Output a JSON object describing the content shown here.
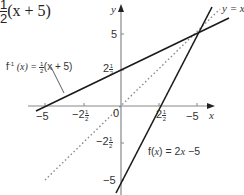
{
  "header_fragment": {
    "frac_num": "1",
    "frac_den": "2",
    "expr": "(x + 5)"
  },
  "axes": {
    "x_label": "x",
    "y_label": "y",
    "origin_label": "0",
    "x_ticks": [
      {
        "value": -5,
        "label": "−5"
      },
      {
        "value": -2.5,
        "whole": "−2",
        "num": "1",
        "den": "2"
      },
      {
        "value": 2.5,
        "whole": "2",
        "num": "1",
        "den": "2"
      },
      {
        "value": 5,
        "label": "−5"
      }
    ],
    "y_ticks": [
      {
        "value": 5,
        "label": "5"
      },
      {
        "value": 2.5,
        "whole": "2",
        "num": "1",
        "den": "2"
      },
      {
        "value": -2.5,
        "whole": "−2",
        "num": "1",
        "den": "2"
      },
      {
        "value": -5,
        "label": "−5"
      }
    ]
  },
  "labels": {
    "inverse": {
      "prefix": "f",
      "sup": "-1",
      "arg": " (x) = ",
      "num": "1",
      "den": "2",
      "rest": "(x + 5)"
    },
    "function": {
      "text_pre": "f(",
      "var": "x",
      "text_post": ") = 2",
      "var2": "x",
      "text_end": " −5"
    },
    "identity": {
      "text": "y = x"
    }
  },
  "lines": [
    {
      "name": "f(x) = 2x − 5",
      "slope": 2,
      "intercept": -5,
      "style": "solid",
      "color": "#1a1a1a"
    },
    {
      "name": "f⁻¹(x) = ½(x + 5)",
      "slope": 0.5,
      "intercept": 2.5,
      "style": "solid",
      "color": "#1a1a1a"
    },
    {
      "name": "y = x",
      "slope": 1,
      "intercept": 0,
      "style": "dotted",
      "color": "#888888"
    }
  ],
  "intersection": {
    "x": 5,
    "y": 5
  }
}
